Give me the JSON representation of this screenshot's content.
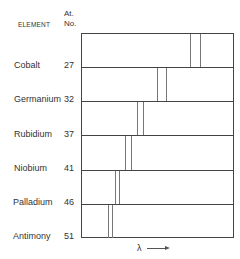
{
  "headers": {
    "element": "ELEMENT",
    "at_no_line1": "At.",
    "at_no_line2": "No."
  },
  "rows": [
    {
      "element": "Cobalt",
      "at_no": "27",
      "lines_x": [
        108,
        118
      ]
    },
    {
      "element": "Germanium",
      "at_no": "32",
      "lines_x": [
        75,
        84
      ]
    },
    {
      "element": "Rubidium",
      "at_no": "37",
      "lines_x": [
        55,
        61
      ]
    },
    {
      "element": "Niobium",
      "at_no": "41",
      "lines_x": [
        43,
        49
      ]
    },
    {
      "element": "Palladium",
      "at_no": "46",
      "lines_x": [
        33,
        37
      ]
    },
    {
      "element": "Antimony",
      "at_no": "51",
      "lines_x": [
        26,
        30
      ]
    }
  ],
  "axis": {
    "label": "λ",
    "arrow": "right-arrow"
  }
}
